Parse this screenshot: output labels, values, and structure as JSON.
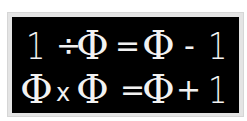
{
  "colors": {
    "background": "#ffffff",
    "frame": "#e4e4e4",
    "panel": "#000000",
    "text": "#f2f2f2"
  },
  "equations": [
    {
      "text": "1 ÷ Φ = Φ − 1",
      "tokens": {
        "a": "1",
        "op1": "÷",
        "b": "Φ",
        "eq": "=",
        "c": "Φ",
        "op2": "-",
        "d": "1"
      }
    },
    {
      "text": "Φ x Φ = Φ + 1",
      "tokens": {
        "a": "Φ",
        "op1": "x",
        "b": "Φ",
        "eq": "=",
        "c": "Φ",
        "op2": "+",
        "d": "1"
      }
    }
  ]
}
